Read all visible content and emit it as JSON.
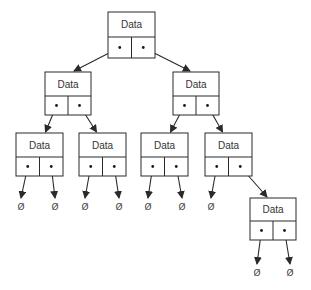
{
  "diagram": {
    "type": "binary-tree",
    "colors": {
      "stroke": "#2a2a2a",
      "text": "#333333",
      "background": "#ffffff"
    },
    "node_label": "Data",
    "null_symbol": "Ø",
    "nodes": [
      {
        "id": "root",
        "label": "Data",
        "x": 108,
        "y": 12,
        "w": 47,
        "h": 46,
        "left": "n1",
        "right": "n2"
      },
      {
        "id": "n1",
        "label": "Data",
        "x": 45,
        "y": 72,
        "w": 46,
        "h": 43,
        "left": "n3",
        "right": "n4"
      },
      {
        "id": "n2",
        "label": "Data",
        "x": 173,
        "y": 72,
        "w": 46,
        "h": 43,
        "left": "n5",
        "right": "n6"
      },
      {
        "id": "n3",
        "label": "Data",
        "x": 16,
        "y": 133,
        "w": 47,
        "h": 43,
        "left": null,
        "right": null
      },
      {
        "id": "n4",
        "label": "Data",
        "x": 79,
        "y": 133,
        "w": 47,
        "h": 43,
        "left": null,
        "right": null
      },
      {
        "id": "n5",
        "label": "Data",
        "x": 141,
        "y": 133,
        "w": 47,
        "h": 43,
        "left": null,
        "right": null
      },
      {
        "id": "n6",
        "label": "Data",
        "x": 205,
        "y": 133,
        "w": 47,
        "h": 43,
        "left": null,
        "right": "n7"
      },
      {
        "id": "n7",
        "label": "Data",
        "x": 250,
        "y": 198,
        "w": 46,
        "h": 42,
        "left": null,
        "right": null
      }
    ],
    "nulls": [
      {
        "label": "Ø",
        "x": 21,
        "y": 210
      },
      {
        "label": "Ø",
        "x": 55,
        "y": 210
      },
      {
        "label": "Ø",
        "x": 85,
        "y": 210
      },
      {
        "label": "Ø",
        "x": 119,
        "y": 210
      },
      {
        "label": "Ø",
        "x": 148,
        "y": 210
      },
      {
        "label": "Ø",
        "x": 182,
        "y": 210
      },
      {
        "label": "Ø",
        "x": 211,
        "y": 210
      },
      {
        "label": "Ø",
        "x": 257,
        "y": 276
      },
      {
        "label": "Ø",
        "x": 290,
        "y": 276
      }
    ]
  }
}
